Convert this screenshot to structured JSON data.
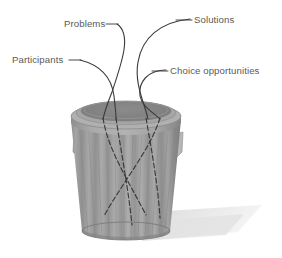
{
  "figure": {
    "background_color": "#ffffff",
    "label_color": "#5a5a5a",
    "line_color": "#3d3d3d",
    "can_color": "#9a9a9a",
    "can_rim_color": "#a9a9a9",
    "can_interior_color": "#868686",
    "shadow_color": "#e6e6e6"
  },
  "labels": [
    {
      "id": "problems",
      "text": "Problems",
      "x": 64,
      "y": 27,
      "anchor": "start",
      "leader": "line"
    },
    {
      "id": "solutions",
      "text": "Solutions",
      "x": 194,
      "y": 22,
      "anchor": "start",
      "leader": "line"
    },
    {
      "id": "participants",
      "text": "Participants",
      "x": 12,
      "y": 62,
      "anchor": "start",
      "leader": "line"
    },
    {
      "id": "choice-opportunities",
      "text": "Choice opportunities",
      "x": 170,
      "y": 72,
      "anchor": "start",
      "leader": "line"
    }
  ],
  "can": {
    "name": "garbage-can",
    "center_x": 126,
    "rim_top_y": 103,
    "rim_bottom_y": 128,
    "base_y": 237,
    "top_radius_x": 55,
    "top_radius_y": 13,
    "bottom_radius_x": 44,
    "bottom_radius_y": 9,
    "rib_count": 13,
    "handles": [
      {
        "id": "handle-left",
        "x": 73,
        "y": 133
      },
      {
        "id": "handle-right",
        "x": 180,
        "y": 133
      }
    ]
  },
  "streams": [
    {
      "id": "stream-problems",
      "label": "Problems"
    },
    {
      "id": "stream-solutions",
      "label": "Solutions"
    },
    {
      "id": "stream-participants",
      "label": "Participants"
    },
    {
      "id": "stream-choice-opportunities",
      "label": "Choice opportunities"
    }
  ]
}
